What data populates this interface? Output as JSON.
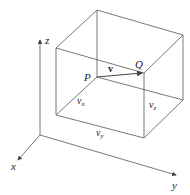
{
  "diagram": {
    "title": "",
    "axes": {
      "x_label": "x",
      "y_label": "y",
      "z_label": "z"
    },
    "points": {
      "P": "P",
      "Q": "Q"
    },
    "vector_label": "v",
    "components": {
      "vx": {
        "base": "v",
        "sub": "x"
      },
      "vy": {
        "base": "v",
        "sub": "y"
      },
      "vz": {
        "base": "v",
        "sub": "z"
      }
    },
    "colors": {
      "line": "#555555",
      "text": "#222222",
      "background": "#ffffff"
    }
  }
}
